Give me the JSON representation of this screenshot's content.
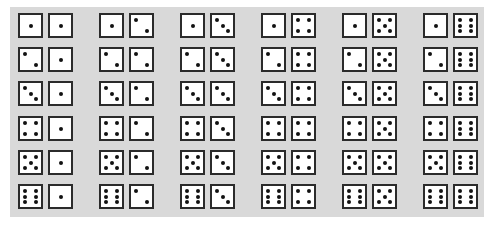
{
  "figure": {
    "rows": 6,
    "columns": 6,
    "colors": {
      "background": "#ffffff",
      "panel": "#d9d9d9",
      "die_face": "#ffffff",
      "die_border": "#2b2b2b",
      "pip": "#111111"
    },
    "outcomes": [
      [
        [
          1,
          1
        ],
        [
          1,
          2
        ],
        [
          1,
          3
        ],
        [
          1,
          4
        ],
        [
          1,
          5
        ],
        [
          1,
          6
        ]
      ],
      [
        [
          2,
          1
        ],
        [
          2,
          2
        ],
        [
          2,
          3
        ],
        [
          2,
          4
        ],
        [
          2,
          5
        ],
        [
          2,
          6
        ]
      ],
      [
        [
          3,
          1
        ],
        [
          3,
          2
        ],
        [
          3,
          3
        ],
        [
          3,
          4
        ],
        [
          3,
          5
        ],
        [
          3,
          6
        ]
      ],
      [
        [
          4,
          1
        ],
        [
          4,
          2
        ],
        [
          4,
          3
        ],
        [
          4,
          4
        ],
        [
          4,
          5
        ],
        [
          4,
          6
        ]
      ],
      [
        [
          5,
          1
        ],
        [
          5,
          2
        ],
        [
          5,
          3
        ],
        [
          5,
          4
        ],
        [
          5,
          5
        ],
        [
          5,
          6
        ]
      ],
      [
        [
          6,
          1
        ],
        [
          6,
          2
        ],
        [
          6,
          3
        ],
        [
          6,
          4
        ],
        [
          6,
          5
        ],
        [
          6,
          6
        ]
      ]
    ]
  }
}
